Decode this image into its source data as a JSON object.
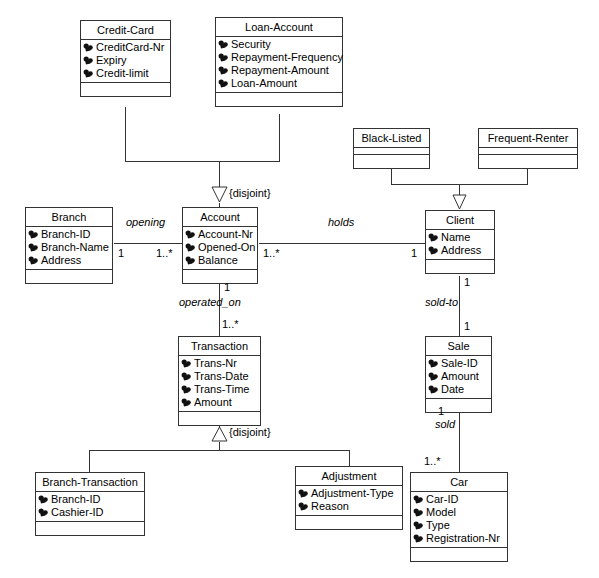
{
  "diagram": {
    "attribute_icon": "private-attribute-icon",
    "line_color": "#333333",
    "background": "#ffffff"
  },
  "classes": [
    {
      "id": "credit-card",
      "name": "Credit-Card",
      "attributes": [
        "CreditCard-Nr",
        "Expiry",
        "Credit-limit"
      ]
    },
    {
      "id": "loan-account",
      "name": "Loan-Account",
      "attributes": [
        "Security",
        "Repayment-Frequency",
        "Repayment-Amount",
        "Loan-Amount"
      ]
    },
    {
      "id": "black-listed",
      "name": "Black-Listed",
      "attributes": []
    },
    {
      "id": "frequent-renter",
      "name": "Frequent-Renter",
      "attributes": []
    },
    {
      "id": "branch",
      "name": "Branch",
      "attributes": [
        "Branch-ID",
        "Branch-Name",
        "Address"
      ]
    },
    {
      "id": "account",
      "name": "Account",
      "attributes": [
        "Account-Nr",
        "Opened-On",
        "Balance"
      ]
    },
    {
      "id": "client",
      "name": "Client",
      "attributes": [
        "Name",
        "Address"
      ]
    },
    {
      "id": "transaction",
      "name": "Transaction",
      "attributes": [
        "Trans-Nr",
        "Trans-Date",
        "Trans-Time",
        "Amount"
      ]
    },
    {
      "id": "sale",
      "name": "Sale",
      "attributes": [
        "Sale-ID",
        "Amount",
        "Date"
      ]
    },
    {
      "id": "branch-transaction",
      "name": "Branch-Transaction",
      "attributes": [
        "Branch-ID",
        "Cashier-ID"
      ]
    },
    {
      "id": "adjustment",
      "name": "Adjustment",
      "attributes": [
        "Adjustment-Type",
        "Reason"
      ]
    },
    {
      "id": "car",
      "name": "Car",
      "attributes": [
        "Car-ID",
        "Model",
        "Type",
        "Registration-Nr"
      ]
    }
  ],
  "associations": [
    {
      "id": "opening",
      "role": "opening",
      "from": "branch",
      "to": "account",
      "from_multiplicity": "1",
      "to_multiplicity": "1..*"
    },
    {
      "id": "holds",
      "role": "holds",
      "from": "account",
      "to": "client",
      "from_multiplicity": "1..*",
      "to_multiplicity": "1"
    },
    {
      "id": "operated_on",
      "role": "operated_on",
      "from": "account",
      "to": "transaction",
      "from_multiplicity": "1",
      "to_multiplicity": "1..*"
    },
    {
      "id": "sold-to",
      "role": "sold-to",
      "from": "client",
      "to": "sale",
      "from_multiplicity": "1",
      "to_multiplicity": "1"
    },
    {
      "id": "sold",
      "role": "sold",
      "from": "sale",
      "to": "car",
      "from_multiplicity": "1",
      "to_multiplicity": "1..*"
    }
  ],
  "generalizations": [
    {
      "id": "account-gen",
      "superclass": "Account",
      "subclasses": [
        "Credit-Card",
        "Loan-Account"
      ],
      "constraint": "{disjoint}"
    },
    {
      "id": "client-gen",
      "superclass": "Client",
      "subclasses": [
        "Black-Listed",
        "Frequent-Renter"
      ],
      "constraint": ""
    },
    {
      "id": "transaction-gen",
      "superclass": "Transaction",
      "subclasses": [
        "Branch-Transaction",
        "Adjustment"
      ],
      "constraint": "{disjoint}"
    }
  ],
  "labels": {
    "opening": "opening",
    "holds": "holds",
    "operated_on": "operated_on",
    "sold_to": "sold-to",
    "sold": "sold",
    "disjoint_account": "{disjoint}",
    "disjoint_transaction": "{disjoint}",
    "m_branch_one": "1",
    "m_account_many_left": "1..*",
    "m_account_many_right": "1..*",
    "m_client_one": "1",
    "m_account_one_down": "1",
    "m_transaction_many": "1..*",
    "m_client_one_down": "1",
    "m_sale_one_up": "1",
    "m_sale_one_down": "1",
    "m_car_many": "1..*"
  }
}
